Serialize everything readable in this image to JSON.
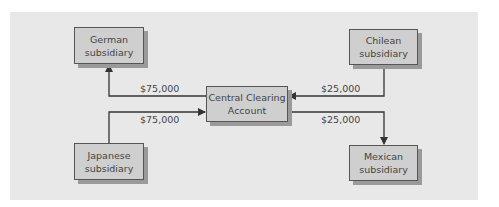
{
  "diagram": {
    "nodes": {
      "german": {
        "line1": "German",
        "line2": "subsidiary"
      },
      "chilean": {
        "line1": "Chilean",
        "line2": "subsidiary"
      },
      "central": {
        "line1": "Central Clearing",
        "line2": "Account"
      },
      "japanese": {
        "line1": "Japanese",
        "line2": "subsidiary"
      },
      "mexican": {
        "line1": "Mexican",
        "line2": "subsidiary"
      }
    },
    "flows": [
      {
        "from": "Central Clearing Account",
        "to": "German subsidiary",
        "amount": "$75,000"
      },
      {
        "from": "Japanese subsidiary",
        "to": "Central Clearing Account",
        "amount": "$75,000"
      },
      {
        "from": "Chilean subsidiary",
        "to": "Central Clearing Account",
        "amount": "$25,000"
      },
      {
        "from": "Central Clearing Account",
        "to": "Mexican subsidiary",
        "amount": "$25,000"
      }
    ]
  },
  "colors": {
    "panel": "#e8e8e8",
    "box": "#cfcfcf",
    "line": "#333333"
  }
}
